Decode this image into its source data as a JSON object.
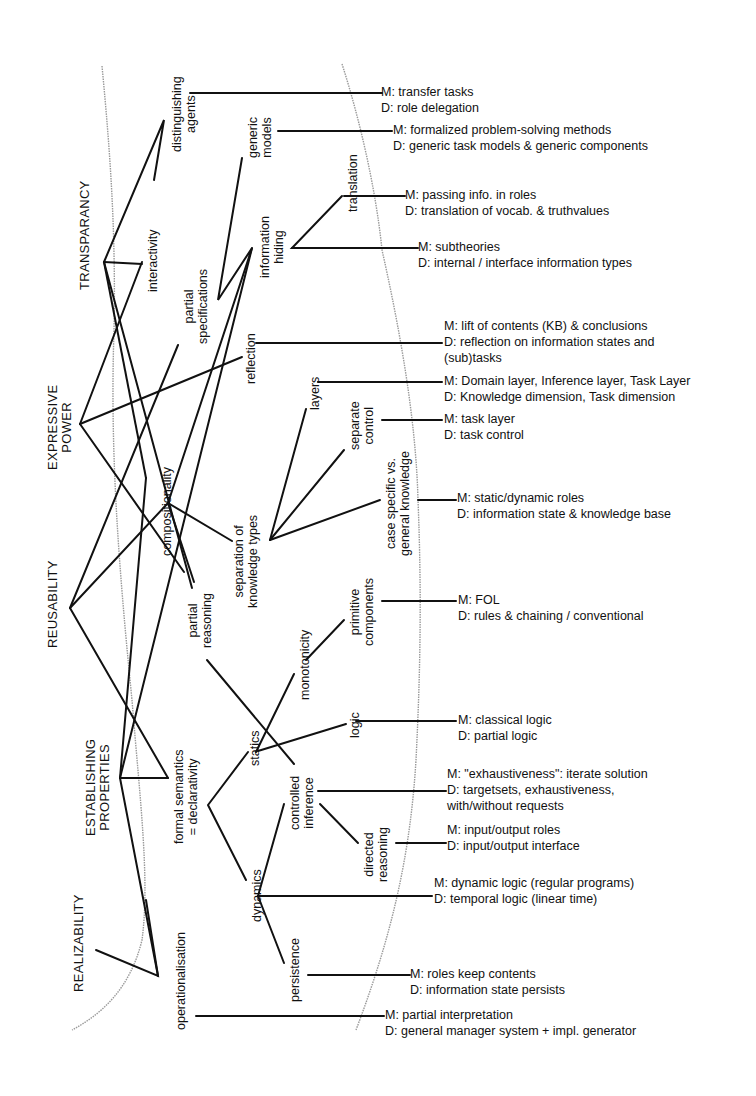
{
  "criteria": [
    {
      "id": "transparancy",
      "label": "TRANSPARANCY"
    },
    {
      "id": "expressive",
      "label": "EXPRESSIVE",
      "label2": "POWER"
    },
    {
      "id": "reusability",
      "label": "REUSABILITY"
    },
    {
      "id": "establishing",
      "label": "ESTABLISHING",
      "label2": "PROPERTIES"
    },
    {
      "id": "realizability",
      "label": "REALIZABILITY"
    }
  ],
  "concepts": {
    "distinguishing_agents": {
      "l1": "distinguishing",
      "l2": "agents"
    },
    "interactivity": {
      "l1": "interactivity"
    },
    "generic_models": {
      "l1": "generic",
      "l2": "models"
    },
    "partial_specifications": {
      "l1": "partial",
      "l2": "specifications"
    },
    "information_hiding": {
      "l1": "information",
      "l2": "hiding"
    },
    "translation": {
      "l1": "translation"
    },
    "reflection": {
      "l1": "reflection"
    },
    "compositionality": {
      "l1": "compositionality"
    },
    "layers": {
      "l1": "layers"
    },
    "separate_control": {
      "l1": "separate",
      "l2": "control"
    },
    "separation_knowledge": {
      "l1": "separation of",
      "l2": "knowledge types"
    },
    "case_specific": {
      "l1": "case specific vs.",
      "l2": "general knowledge"
    },
    "partial_reasoning": {
      "l1": "partial",
      "l2": "reasoning"
    },
    "primitive_components": {
      "l1": "primitive",
      "l2": "components"
    },
    "monotonicity": {
      "l1": "monotonicity"
    },
    "formal_semantics": {
      "l1": "formal semantics",
      "l2": "= declarativity"
    },
    "statics": {
      "l1": "statics"
    },
    "logic": {
      "l1": "logic"
    },
    "controlled_inference": {
      "l1": "controlled",
      "l2": "inference"
    },
    "directed_reasoning": {
      "l1": "directed",
      "l2": "reasoning"
    },
    "dynamics": {
      "l1": "dynamics"
    },
    "persistence": {
      "l1": "persistence"
    },
    "operationalisation": {
      "l1": "operationalisation"
    }
  },
  "descriptions": [
    {
      "id": "distinguishing_agents",
      "m": "M: transfer tasks",
      "d": "D: role delegation"
    },
    {
      "id": "generic_models",
      "m": "M: formalized problem-solving methods",
      "d": "D: generic task models & generic components"
    },
    {
      "id": "translation",
      "m": "M: passing info. in roles",
      "d": "D: translation of vocab. & truthvalues"
    },
    {
      "id": "information_hiding",
      "m": "M: subtheories",
      "d": "D: internal / interface information types"
    },
    {
      "id": "reflection",
      "m": "M: lift of contents (KB) & conclusions",
      "d": "D: reflection on information states and",
      "d2": "(sub)tasks"
    },
    {
      "id": "layers",
      "m": "M: Domain layer, Inference layer, Task Layer",
      "d": "D: Knowledge dimension, Task dimension"
    },
    {
      "id": "separate_control",
      "m": "M: task layer",
      "d": "D: task control"
    },
    {
      "id": "case_specific",
      "m": "M: static/dynamic roles",
      "d": "D: information state & knowledge base"
    },
    {
      "id": "primitive_components",
      "m": "M: FOL",
      "d": "D: rules & chaining / conventional"
    },
    {
      "id": "logic",
      "m": "M: classical logic",
      "d": "D: partial logic"
    },
    {
      "id": "controlled_inference",
      "m": "M: \"exhaustiveness\": iterate solution",
      "d": "D: targetsets, exhaustiveness,",
      "d2": "with/without requests"
    },
    {
      "id": "directed_reasoning",
      "m": "M: input/output roles",
      "d": "D: input/output interface"
    },
    {
      "id": "dynamics",
      "m": "M: dynamic logic (regular programs)",
      "d": "D: temporal logic (linear time)"
    },
    {
      "id": "persistence",
      "m": "M: roles keep contents",
      "d": "D: information state persists"
    },
    {
      "id": "operationalisation",
      "m": "M: partial interpretation",
      "d": "D: general manager system + impl. generator"
    }
  ]
}
